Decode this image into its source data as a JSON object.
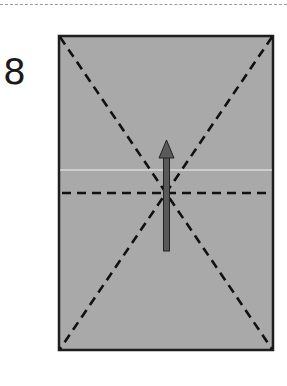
{
  "step": {
    "number": "8"
  },
  "diagram": {
    "paper_color": "#a9a9a9",
    "outline_color": "#1e1e1e",
    "arrow_color": "#5a5a5a",
    "crease_line_color": "#f2f2f2",
    "fold_lines": [
      "diagonal-top-left-to-bottom-right",
      "diagonal-top-right-to-bottom-left",
      "horizontal-center"
    ],
    "arrow_direction": "up"
  }
}
